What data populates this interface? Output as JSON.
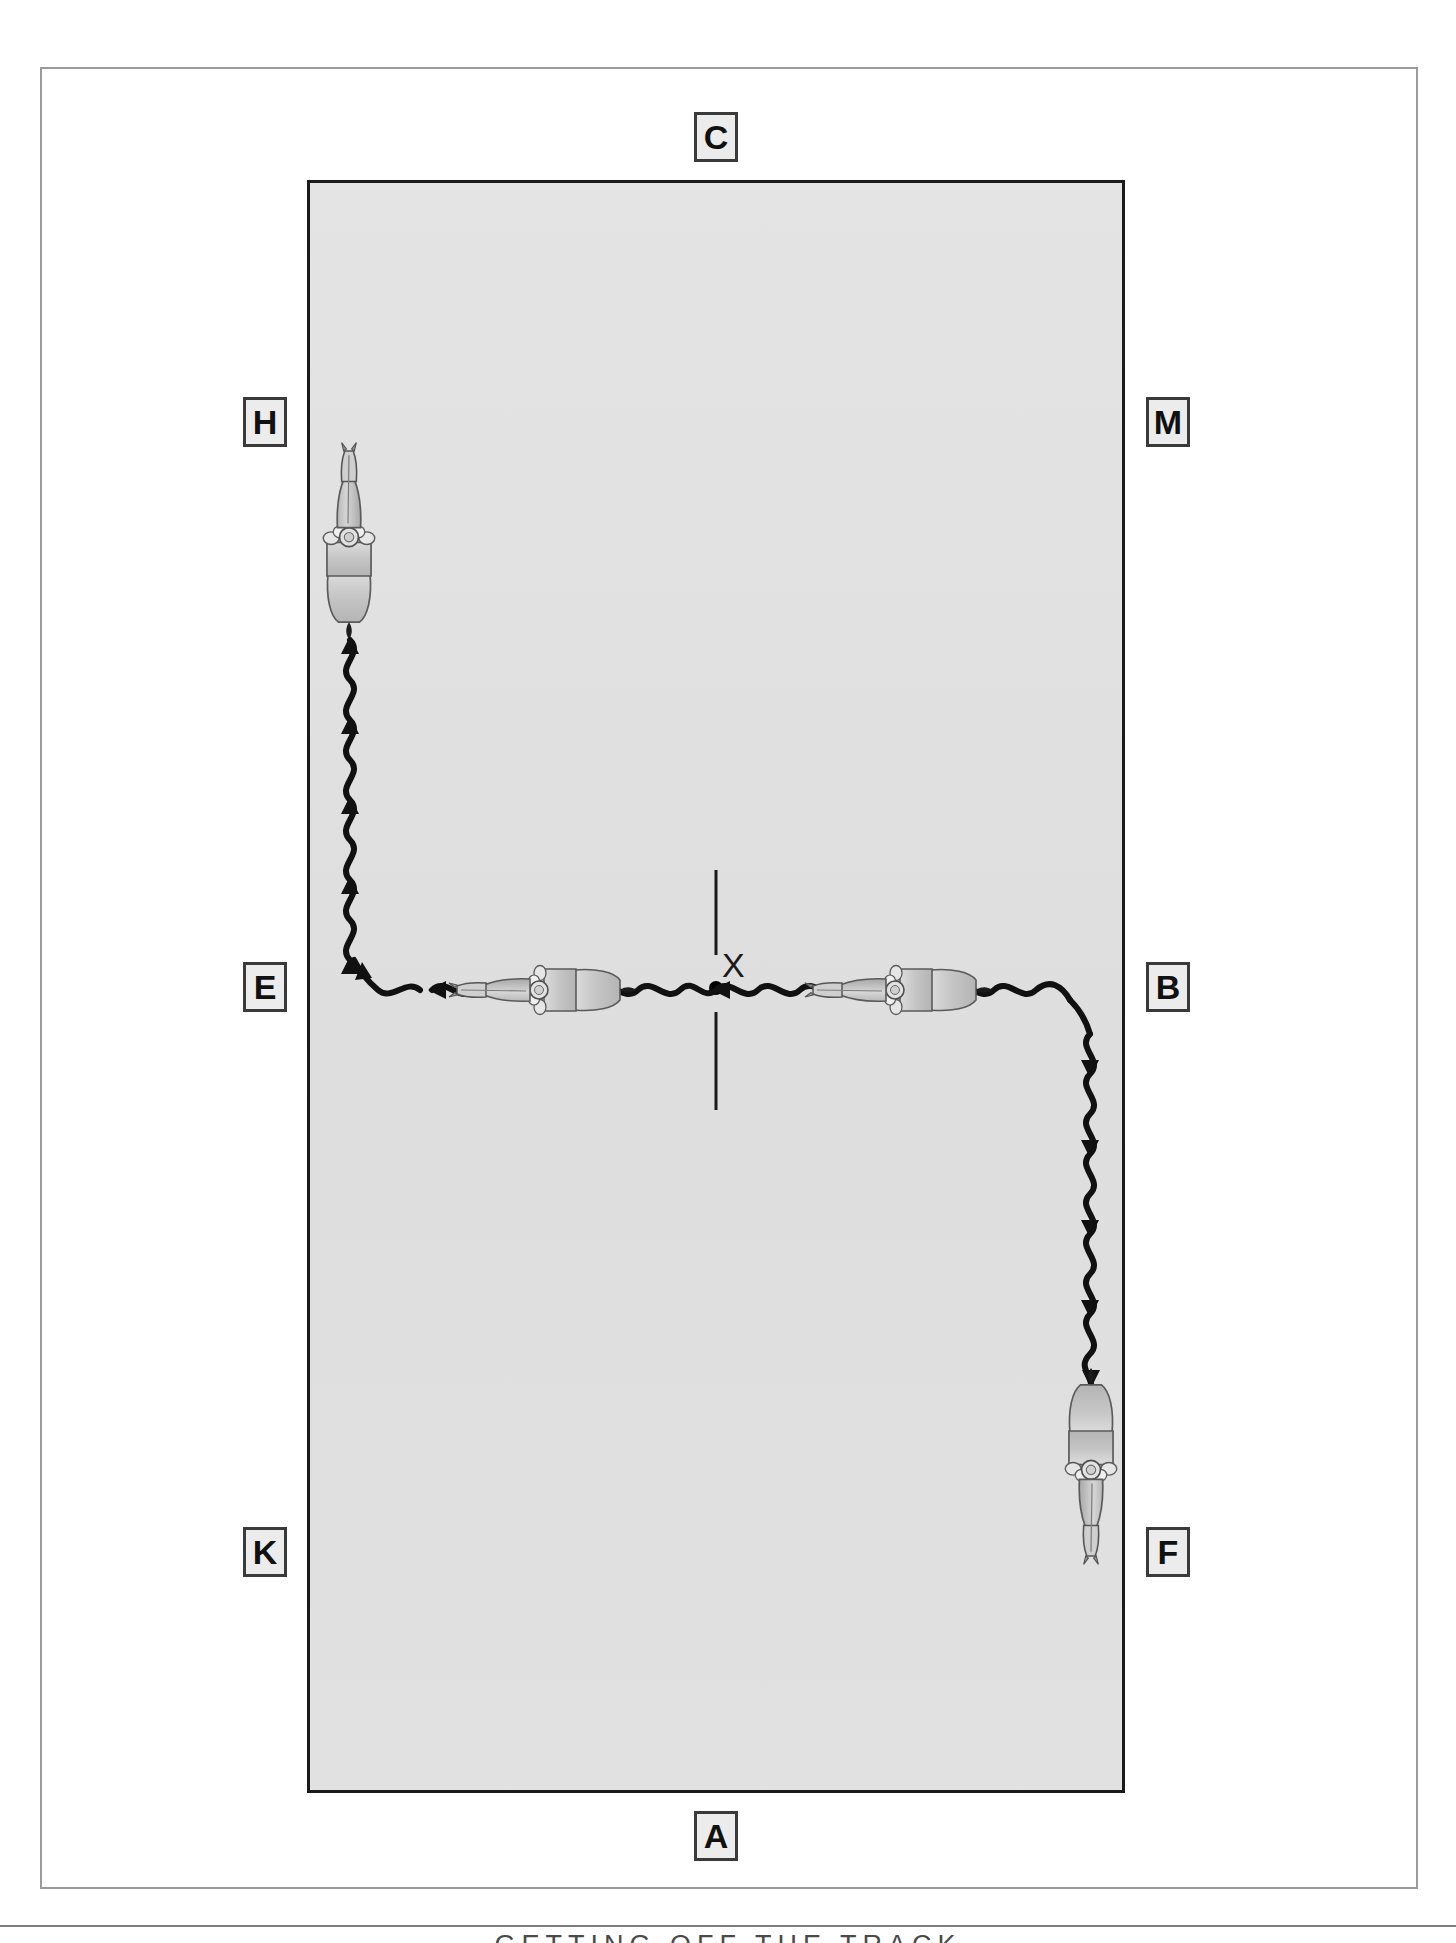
{
  "page": {
    "footer_caption": "GETTING OFF THE TRACK",
    "background_color": "#ffffff",
    "frame_color": "#9a9a9a"
  },
  "arena": {
    "name": "dressage-arena",
    "surface_color": "#e2e2e2",
    "border_color": "#1a1a1a",
    "orientation": "portrait",
    "size_label": "20 x 40"
  },
  "markers": [
    {
      "id": "C",
      "label": "C",
      "side": "top",
      "x": 694,
      "y": 112
    },
    {
      "id": "H",
      "label": "H",
      "side": "left",
      "x": 243,
      "y": 397
    },
    {
      "id": "M",
      "label": "M",
      "side": "right",
      "x": 1146,
      "y": 397
    },
    {
      "id": "E",
      "label": "E",
      "side": "left",
      "x": 243,
      "y": 962
    },
    {
      "id": "B",
      "label": "B",
      "side": "right",
      "x": 1146,
      "y": 962
    },
    {
      "id": "K",
      "label": "K",
      "side": "left",
      "x": 243,
      "y": 1527
    },
    {
      "id": "F",
      "label": "F",
      "side": "right",
      "x": 1146,
      "y": 1527
    },
    {
      "id": "A",
      "label": "A",
      "side": "bottom",
      "x": 694,
      "y": 1811
    }
  ],
  "centre": {
    "label": "X",
    "description": "centre point of the arena",
    "x": 716,
    "y": 987,
    "line_color": "#1a1a1a",
    "dot_color": "#000000"
  },
  "horses": [
    {
      "id": "horse-top-left",
      "heading": "north",
      "position_label": "between E and H on the left track",
      "x": 349,
      "y": 555
    },
    {
      "id": "horse-centre-left",
      "heading": "west",
      "position_label": "on the centre line left of X",
      "x": 538,
      "y": 987
    },
    {
      "id": "horse-centre-right",
      "heading": "west",
      "position_label": "on the centre line right of X",
      "x": 895,
      "y": 987
    },
    {
      "id": "horse-bottom-right",
      "heading": "south",
      "position_label": "between B and F on the right track",
      "x": 1091,
      "y": 1452
    }
  ],
  "tracks": [
    {
      "id": "track-left",
      "description": "wavy track from E corner turning up the left long side toward H",
      "color": "#111111",
      "style": "wavy-with-arrowheads"
    },
    {
      "id": "track-centre",
      "description": "wavy track along the E-X-B centre line",
      "color": "#111111",
      "style": "wavy-with-arrowheads"
    },
    {
      "id": "track-right",
      "description": "wavy track from B corner turning down the right long side toward F",
      "color": "#111111",
      "style": "wavy-with-arrowheads"
    }
  ],
  "colors": {
    "ink": "#111111",
    "arena_fill": "#e2e2e2",
    "marker_fill": "#ececec",
    "marker_border": "#3a3a3a",
    "horse_body": "#c9c9c9",
    "horse_outline": "#555555"
  }
}
